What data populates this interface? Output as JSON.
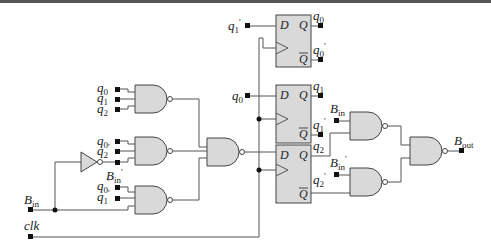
{
  "diagram": {
    "title": "",
    "inputs": {
      "b_in": "B",
      "b_in_sub": "in",
      "clk": "clk"
    },
    "output": {
      "label": "B",
      "sub": "out"
    },
    "gate1_inputs": [
      {
        "label": "q",
        "sub": "0",
        "prime": ""
      },
      {
        "label": "q",
        "sub": "1",
        "prime": ""
      },
      {
        "label": "q",
        "sub": "2",
        "prime": ""
      }
    ],
    "gate2_inputs": [
      {
        "label": "q",
        "sub": "0",
        "prime": ""
      },
      {
        "label": "q",
        "sub": "2",
        "prime": "'"
      }
    ],
    "gate2_bin_label": {
      "label": "B",
      "sub": "in",
      "prime": "'"
    },
    "gate3_inputs": [
      {
        "label": "q",
        "sub": "0",
        "prime": "'"
      },
      {
        "label": "q",
        "sub": "1",
        "prime": "'"
      }
    ],
    "flipflops": [
      {
        "d_input": {
          "label": "q",
          "sub": "1",
          "prime": "'"
        },
        "q": {
          "label": "q",
          "sub": "0",
          "prime": ""
        },
        "qbar": {
          "label": "q",
          "sub": "0",
          "prime": "'"
        },
        "d_pin": "D",
        "q_pin": "Q",
        "qbar_pin": "Q"
      },
      {
        "d_input": {
          "label": "q",
          "sub": "0",
          "prime": ""
        },
        "q": {
          "label": "q",
          "sub": "1",
          "prime": ""
        },
        "qbar": {
          "label": "q",
          "sub": "1",
          "prime": "'"
        },
        "d_pin": "D",
        "q_pin": "Q",
        "qbar_pin": "Q"
      },
      {
        "d_input": null,
        "q": {
          "label": "q",
          "sub": "2",
          "prime": ""
        },
        "qbar": {
          "label": "q",
          "sub": "2",
          "prime": "'"
        },
        "d_pin": "D",
        "q_pin": "Q",
        "qbar_pin": "Q"
      }
    ],
    "out_gate_upper_input": {
      "label": "B",
      "sub": "in",
      "prime": ""
    },
    "out_gate_lower_input": {
      "label": "B",
      "sub": "in",
      "prime": "'"
    }
  }
}
